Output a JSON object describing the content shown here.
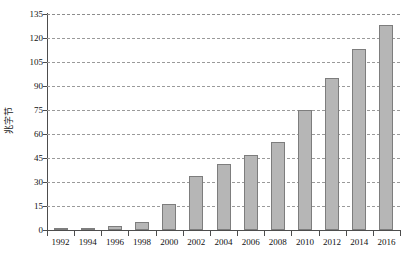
{
  "chart_data": {
    "type": "bar",
    "title": "",
    "xlabel": "",
    "ylabel": "兆字节",
    "categories": [
      "1992",
      "1994",
      "1996",
      "1998",
      "2000",
      "2002",
      "2004",
      "2006",
      "2008",
      "2010",
      "2012",
      "2014",
      "2016"
    ],
    "values": [
      1,
      1.5,
      2.5,
      5,
      16,
      34,
      41,
      47,
      55,
      75,
      95,
      113,
      128
    ],
    "ylim": [
      0,
      135
    ],
    "yticks": [
      0,
      15,
      30,
      45,
      60,
      75,
      90,
      105,
      120,
      135
    ],
    "ytick_labels": [
      "0",
      "15",
      "30",
      "45",
      "60",
      "75",
      "90",
      "105",
      "120",
      "135"
    ],
    "grid": true,
    "grid_axis": "y",
    "grid_style": "dashed",
    "legend": "none",
    "bar_fill_color": "#b6b6b6",
    "bar_edge_color": "#7d7d7d",
    "axis_color": "#4d4d4d",
    "grid_color": "#9a9a9a"
  }
}
